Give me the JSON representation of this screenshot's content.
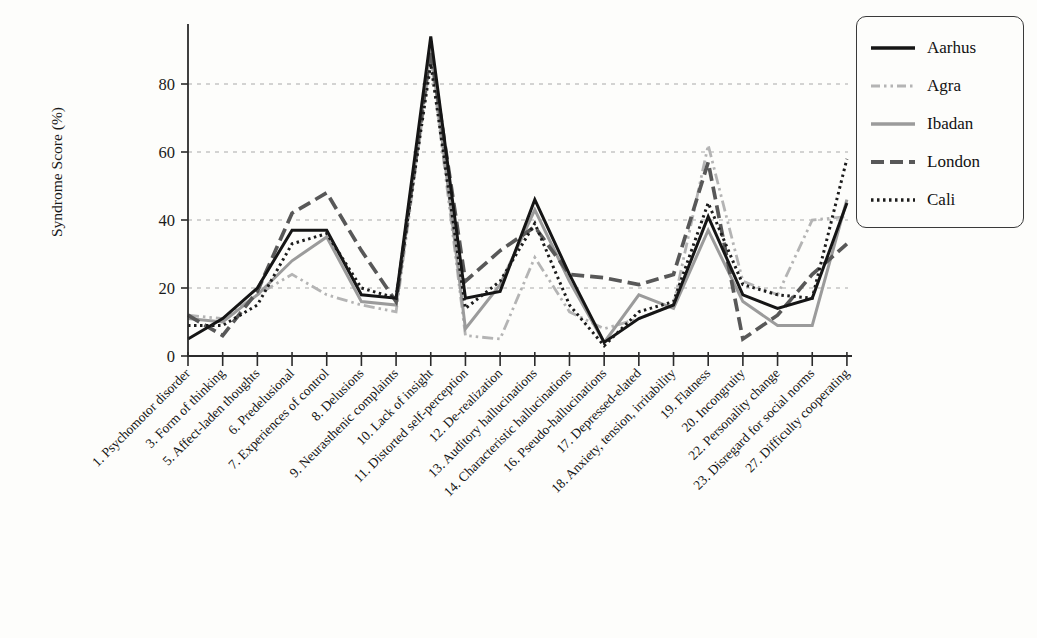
{
  "chart_data": {
    "type": "line",
    "title": "",
    "ylabel": "Syndrome Score (%)",
    "xlabel": "",
    "ylim": [
      0,
      100
    ],
    "yticks": [
      0,
      20,
      40,
      60,
      80
    ],
    "grid": "horizontal dashed gridlines at 20, 40, 60, 80",
    "legend_position": "top-right",
    "axis_color": "#2b2b2b",
    "gridline_color": "#a9a9a9",
    "categories": [
      "1. Psychomotor disorder",
      "3. Form of thinking",
      "5. Affect-laden thoughts",
      "6. Predelusional",
      "7. Experiences of control",
      "8. Delusions",
      "9. Neurasthenic complaints",
      "10. Lack of insight",
      "11. Distorted self-perception",
      "12. De-realization",
      "13. Auditory hallucinations",
      "14. Characteristic hallucinations",
      "16. Pseudo-hallucinations",
      "17. Depressed-elated",
      "18. Anxiety, tension, irritability",
      "19. Flatness",
      "20. Incongruity",
      "22. Personality change",
      "23. Disregard for social norms",
      "27. Difficulty cooperating"
    ],
    "series": [
      {
        "name": "Aarhus",
        "color": "#151515",
        "dash": "solid",
        "values": [
          5,
          11,
          20,
          37,
          37,
          18,
          17,
          94,
          17,
          19,
          46,
          24,
          4,
          11,
          15,
          41,
          18,
          14,
          17,
          45
        ]
      },
      {
        "name": "Agra",
        "color": "#b4b4b4",
        "dash": "dash-dot-dot",
        "values": [
          12,
          11,
          18,
          24,
          18,
          15,
          13,
          88,
          6,
          5,
          29,
          13,
          8,
          11,
          15,
          62,
          22,
          18,
          40,
          41
        ]
      },
      {
        "name": "Ibadan",
        "color": "#9b9b9b",
        "dash": "solid",
        "values": [
          11,
          10,
          18,
          28,
          35,
          16,
          15,
          91,
          8,
          21,
          43,
          22,
          4,
          18,
          14,
          37,
          16,
          9,
          9,
          46
        ]
      },
      {
        "name": "London",
        "color": "#585858",
        "dash": "long-dash",
        "values": [
          12,
          6,
          19,
          42,
          48,
          31,
          16,
          90,
          22,
          31,
          38,
          24,
          23,
          21,
          24,
          57,
          5,
          12,
          24,
          33
        ]
      },
      {
        "name": "Cali",
        "color": "#1c1c1c",
        "dash": "dotted",
        "values": [
          9,
          9,
          15,
          33,
          36,
          20,
          17,
          86,
          14,
          22,
          39,
          15,
          3,
          13,
          16,
          45,
          21,
          18,
          17,
          58
        ]
      }
    ]
  }
}
